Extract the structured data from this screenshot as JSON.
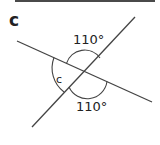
{
  "diagram": {
    "part_label": "c",
    "angles": [
      {
        "id": "top",
        "label": "110°"
      },
      {
        "id": "left",
        "label": "c"
      },
      {
        "id": "bottom",
        "label": "110°"
      }
    ],
    "colors": {
      "line": "#444444",
      "text": "#222222",
      "background": "#ffffff"
    }
  }
}
